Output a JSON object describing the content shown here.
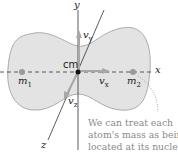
{
  "diagram": {
    "type": "diatomic-molecule-center-of-mass",
    "axes": {
      "x": {
        "label": "x"
      },
      "y": {
        "label": "y"
      },
      "z": {
        "label": "z"
      }
    },
    "center_of_mass": {
      "label": "cm"
    },
    "masses": [
      {
        "label_main": "m",
        "label_sub": "1"
      },
      {
        "label_main": "m",
        "label_sub": "2"
      }
    ],
    "velocities": [
      {
        "label_main": "v",
        "label_sub": "x"
      },
      {
        "label_main": "v",
        "label_sub": "y"
      },
      {
        "label_main": "v",
        "label_sub": "z"
      }
    ],
    "caption": {
      "lines": [
        "We can treat each",
        "atom's mass as being",
        "located at its nucleus."
      ]
    },
    "colors": {
      "molecule_fill": "#e3e3e3",
      "molecule_stroke": "#9a9a9a",
      "axis": "#333333",
      "nucleus": "#9a9a9a",
      "arrow": "#a8a8a8",
      "caption_text": "#8a8a8a"
    }
  }
}
